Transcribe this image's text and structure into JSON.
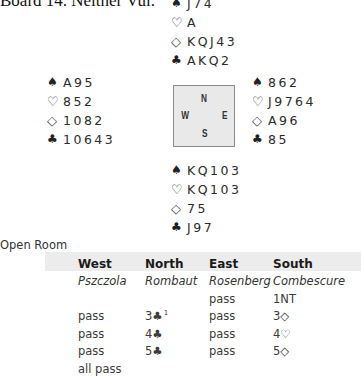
{
  "title": "Board 14. Neither Vul.",
  "hands": {
    "north": [
      {
        "suit": "spades",
        "symbol": "♠",
        "cards": "J74"
      },
      {
        "suit": "hearts",
        "symbol": "♡",
        "cards": "A"
      },
      {
        "suit": "diamonds",
        "symbol": "◇",
        "cards": "KQJ43"
      },
      {
        "suit": "clubs",
        "symbol": "♣",
        "cards": "AKQ2"
      }
    ],
    "west": [
      {
        "suit": "spades",
        "symbol": "♠",
        "cards": "A95"
      },
      {
        "suit": "hearts",
        "symbol": "♡",
        "cards": "852"
      },
      {
        "suit": "diamonds",
        "symbol": "◇",
        "cards": "1082"
      },
      {
        "suit": "clubs",
        "symbol": "♣",
        "cards": "10643"
      }
    ],
    "east": [
      {
        "suit": "spades",
        "symbol": "♠",
        "cards": "862"
      },
      {
        "suit": "hearts",
        "symbol": "♡",
        "cards": "J9764"
      },
      {
        "suit": "diamonds",
        "symbol": "◇",
        "cards": "A96"
      },
      {
        "suit": "clubs",
        "symbol": "♣",
        "cards": "85"
      }
    ],
    "south": [
      {
        "suit": "spades",
        "symbol": "♠",
        "cards": "KQ103"
      },
      {
        "suit": "hearts",
        "symbol": "♡",
        "cards": "KQ103"
      },
      {
        "suit": "diamonds",
        "symbol": "◇",
        "cards": "75"
      },
      {
        "suit": "clubs",
        "symbol": "♣",
        "cards": "J97"
      }
    ]
  },
  "compass": {
    "n": "N",
    "s": "S",
    "w": "W",
    "e": "E"
  },
  "room": "Open Room",
  "auction": {
    "headers": [
      "West",
      "North",
      "East",
      "South"
    ],
    "players": [
      "Pszczola",
      "Rombaut",
      "Rosenberg",
      "Combescure"
    ],
    "rows": [
      [
        "",
        "",
        "pass",
        "1NT"
      ],
      [
        "pass",
        "3♣",
        "pass",
        "3◇"
      ],
      [
        "pass",
        "4♣",
        "pass",
        "4♡"
      ],
      [
        "pass",
        "5♣",
        "pass",
        "5◇"
      ],
      [
        "all pass",
        "",
        "",
        ""
      ]
    ],
    "footnote_marker": {
      "row": 1,
      "col": 1,
      "text": "1"
    }
  }
}
